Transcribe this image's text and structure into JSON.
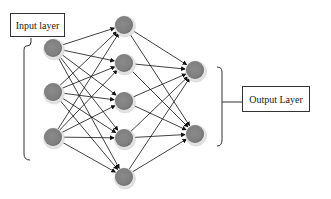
{
  "diagram": {
    "labels": {
      "input": "Input layer",
      "output": "Output Layer"
    },
    "layers": [
      {
        "name": "input",
        "nodes": [
          {
            "x": 53,
            "y": 48
          },
          {
            "x": 53,
            "y": 92
          },
          {
            "x": 53,
            "y": 137
          }
        ]
      },
      {
        "name": "hidden",
        "nodes": [
          {
            "x": 124,
            "y": 25
          },
          {
            "x": 124,
            "y": 63
          },
          {
            "x": 124,
            "y": 101
          },
          {
            "x": 124,
            "y": 138
          },
          {
            "x": 124,
            "y": 177
          }
        ]
      },
      {
        "name": "output",
        "nodes": [
          {
            "x": 195,
            "y": 70
          },
          {
            "x": 195,
            "y": 134
          }
        ]
      }
    ],
    "colors": {
      "node_fill": "#8c8c8c",
      "node_ring": "#d8d8d8",
      "edge": "#111111"
    }
  }
}
